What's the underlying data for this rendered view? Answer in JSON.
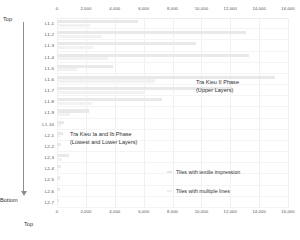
{
  "chart_data": {
    "type": "bar",
    "orientation": "horizontal",
    "title": "",
    "xlabel": "Top",
    "ylabel": "",
    "xlim": [
      0,
      16000
    ],
    "grid": true,
    "legend_position": "bottom-right",
    "xticks": [
      "0",
      "2,000",
      "4,000",
      "6,000",
      "8,000",
      "10,000",
      "12,000",
      "14,000",
      "16,000"
    ],
    "xtick_values": [
      0,
      2000,
      4000,
      6000,
      8000,
      10000,
      12000,
      14000,
      16000
    ],
    "categories": [
      "L1-1",
      "L1-2",
      "L1-3",
      "L1-4",
      "L1-5",
      "L1-6",
      "L1-7",
      "L1-8",
      "L1-9",
      "L1-10",
      "L2-1",
      "L2-2",
      "L2-3",
      "L2-4",
      "L2-5",
      "L2-6",
      "L2-7"
    ],
    "series": [
      {
        "name": "Tiles with textile impression",
        "color": "#e9e9e9",
        "values": [
          5600,
          13100,
          9600,
          13300,
          3900,
          15100,
          12100,
          7300,
          2200,
          500,
          450,
          300,
          800,
          260,
          200,
          180,
          160
        ]
      },
      {
        "name": "Tiles with multiple lines",
        "color": "#f2f2f2",
        "values": [
          2300,
          3100,
          2500,
          3500,
          1400,
          6800,
          6000,
          2400,
          900,
          260,
          200,
          150,
          340,
          120,
          100,
          90,
          80
        ]
      }
    ],
    "annotations": [
      {
        "name": "upper-phase",
        "lines": [
          "Tra Kieu II Phase",
          "(Upper Layers)"
        ]
      },
      {
        "name": "lower-phase",
        "lines": [
          "Tra Kieu Ia and Ib Phase",
          "(Lowest and Lower Layers)"
        ]
      }
    ]
  },
  "axis": {
    "depth_top_label": "Top",
    "depth_bottom_label": "Bottom",
    "xaxis_title": "Top"
  },
  "legend": {
    "items": [
      {
        "label": "Tiles with textile impression"
      },
      {
        "label": "Tiles with multiple lines"
      }
    ]
  },
  "annotations": {
    "upper": {
      "line1": "Tra Kieu II Phase",
      "line2": "(Upper Layers)"
    },
    "lower": {
      "line1": "Tra Kieu Ia and Ib Phase",
      "line2": "(Lowest and Lower Layers)"
    }
  }
}
